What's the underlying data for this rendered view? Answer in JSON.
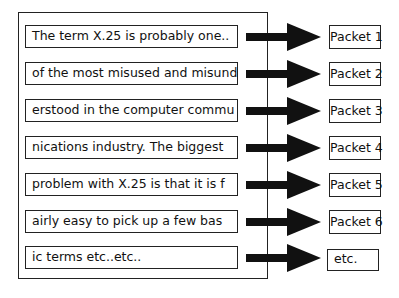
{
  "diagram": {
    "rows": [
      {
        "segment": "The term X.25 is probably one..",
        "packet": "Packet 1"
      },
      {
        "segment": "of the most misused and misund",
        "packet": "Packet 2"
      },
      {
        "segment": "erstood in the computer commu",
        "packet": "Packet 3"
      },
      {
        "segment": "nications industry. The biggest",
        "packet": "Packet 4"
      },
      {
        "segment": "problem with X.25 is that it is f",
        "packet": "Packet 5"
      },
      {
        "segment": "airly easy to pick up a few bas",
        "packet": "Packet 6"
      },
      {
        "segment": "ic terms etc..etc..",
        "packet": "etc."
      }
    ],
    "colors": {
      "line": "#222222",
      "background": "#ffffff"
    }
  }
}
